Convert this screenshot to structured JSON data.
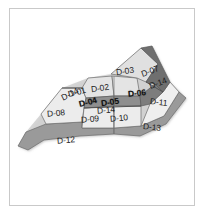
{
  "figure": {
    "width": 204,
    "height": 216,
    "background_color": "#ffffff",
    "frame_color": "#c9c9c9"
  },
  "palette": {
    "light_fill": "#ececec",
    "mid_fill": "#d8d8d8",
    "dark_fill": "#8f8f8f",
    "darker_fill": "#6f6f6f",
    "corridor_fill": "#9a9a9a",
    "outline": "#6a6a6a",
    "label_color": "#1a1a1a"
  },
  "zones": [
    {
      "id": "D-01",
      "label": "D-01",
      "style": "light",
      "label_x": 68,
      "label_y": 92,
      "tilt": "tilt-a",
      "dark_label": false,
      "points": "88,78 112,76 114,96 86,98 82,88"
    },
    {
      "id": "D-02",
      "label": "D-02",
      "style": "light",
      "label_x": 91,
      "label_y": 88,
      "tilt": "tilt-c",
      "dark_label": false,
      "points": "112,76 137,78 140,96 114,96"
    },
    {
      "id": "D-03",
      "label": "D-03",
      "style": "light",
      "label_x": 116,
      "label_y": 71,
      "tilt": "tilt-c",
      "dark_label": false,
      "points": "111,74 141,48 158,64 146,82 137,78"
    },
    {
      "id": "D-04",
      "label": "D-04",
      "style": "dark",
      "label_x": 79,
      "label_y": 100,
      "tilt": "tilt-a",
      "dark_label": true,
      "points": "86,98 114,96 114,106 84,108"
    },
    {
      "id": "D-05",
      "label": "D-05",
      "style": "dark",
      "label_x": 101,
      "label_y": 100,
      "tilt": "tilt-c",
      "dark_label": true,
      "points": "114,96 140,96 141,106 114,106"
    },
    {
      "id": "D-06",
      "label": "D-06",
      "style": "dark",
      "label_x": 128,
      "label_y": 91,
      "tilt": "tilt-d",
      "dark_label": true,
      "points": "140,96 155,84 163,92 150,104 141,106"
    },
    {
      "id": "D-07",
      "label": "D-07",
      "style": "dark",
      "label_x": 141,
      "label_y": 71,
      "tilt": "tilt-b",
      "dark_label": false,
      "points": "141,48 158,64 146,82 155,84 163,92 170,82 152,46"
    },
    {
      "id": "D-08",
      "label": "D-08",
      "style": "light",
      "label_x": 47,
      "label_y": 113,
      "tilt": "tilt-d",
      "dark_label": false,
      "points": "41,114 62,88 82,88 86,98 84,108 82,122 46,124"
    },
    {
      "id": "D-09",
      "label": "D-09",
      "style": "light",
      "label_x": 81,
      "label_y": 119,
      "tilt": "tilt-d",
      "dark_label": false,
      "points": "84,108 114,106 114,128 82,128"
    },
    {
      "id": "D-10",
      "label": "D-10",
      "style": "light",
      "label_x": 110,
      "label_y": 118,
      "tilt": "tilt-d",
      "dark_label": false,
      "points": "114,106 141,106 141,126 114,128"
    },
    {
      "id": "D-11",
      "label": "D-11",
      "style": "light",
      "label_x": 150,
      "label_y": 102,
      "tilt": "tilt-e",
      "dark_label": false,
      "points": "150,104 163,92 170,82 179,92 164,116 141,126"
    },
    {
      "id": "D-12",
      "label": "D-12",
      "style": "corridor",
      "label_x": 57,
      "label_y": 140,
      "tilt": "tilt-d",
      "dark_label": false,
      "points": "18,146 26,132 46,124 82,122 82,128 114,128 114,134 80,136 44,140 28,150"
    },
    {
      "id": "D-13",
      "label": "D-13",
      "style": "corridor",
      "label_x": 143,
      "label_y": 127,
      "tilt": "tilt-e",
      "dark_label": false,
      "points": "114,128 141,126 164,116 179,92 186,98 166,124 140,136 114,134"
    },
    {
      "id": "D-14a",
      "label": "D-14",
      "style": "line",
      "label_x": 61,
      "label_y": 94,
      "tilt": "tilt-f",
      "dark_label": false,
      "points": ""
    },
    {
      "id": "D-14b",
      "label": "D-14",
      "style": "line",
      "label_x": 97,
      "label_y": 110,
      "tilt": "tilt-d",
      "dark_label": false,
      "points": ""
    },
    {
      "id": "D-14c",
      "label": "D-14",
      "style": "line",
      "label_x": 149,
      "label_y": 83,
      "tilt": "tilt-b",
      "dark_label": false,
      "points": ""
    }
  ]
}
